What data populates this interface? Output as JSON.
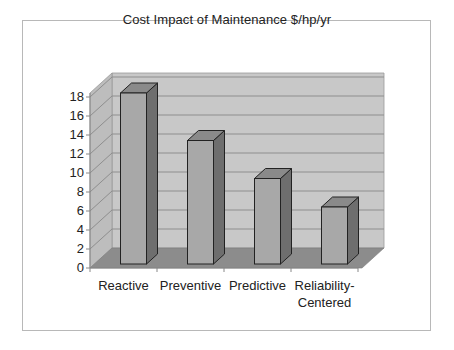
{
  "chart_data": {
    "type": "bar",
    "style": "3d-column",
    "title": "Cost Impact of Maintenance $/hp/yr",
    "xlabel": "",
    "ylabel": "",
    "categories": [
      "Reactive",
      "Preventive",
      "Predictive",
      "Reliability-Centered"
    ],
    "category_label_lines": [
      [
        "Reactive"
      ],
      [
        "Preventive"
      ],
      [
        "Predictive"
      ],
      [
        "Reliability-",
        "Centered"
      ]
    ],
    "values": [
      18,
      13,
      9,
      6
    ],
    "ylim": [
      0,
      18
    ],
    "yticks": [
      0,
      2,
      4,
      6,
      8,
      10,
      12,
      14,
      16,
      18
    ],
    "grid": true,
    "legend": null,
    "colors": {
      "bar_front": "#a8a8a8",
      "bar_side": "#6e6e6e",
      "bar_top": "#8a8a8a",
      "wall": "#c8c8c8",
      "side_wall": "#bdbdbd",
      "floor": "#8c8c8c",
      "gridline": "#8e8e8e"
    }
  }
}
